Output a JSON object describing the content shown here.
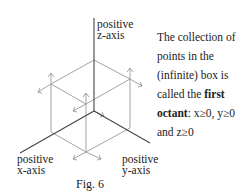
{
  "labels": {
    "z_axis": [
      "positive",
      "z-axis"
    ],
    "x_axis": [
      "positive",
      "x-axis"
    ],
    "y_axis": [
      "positive",
      "y-axis"
    ],
    "caption": "Fig. 6"
  },
  "description": {
    "part1": "The collection of points in the (infinite) box is called the ",
    "bold1": "first",
    "space": " ",
    "bold2": "octant",
    "part2": ":  x≥0, y≥0 and z≥0"
  },
  "colors": {
    "axis": "#444444",
    "box": "#888888",
    "arrow": "#999999"
  }
}
